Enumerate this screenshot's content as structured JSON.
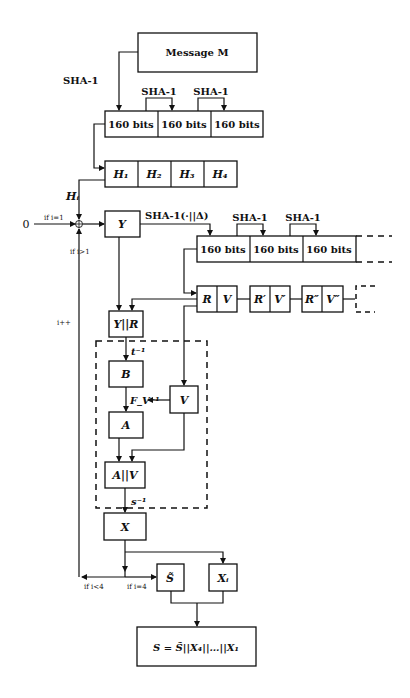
{
  "message": "Message M",
  "sha1": "SHA-1",
  "sha1_delta": "SHA-1(·||Δ)",
  "bits_block": "160 bits",
  "h_blocks": [
    "H₁",
    "H₂",
    "H₃",
    "H₄"
  ],
  "h_i": "Hᵢ",
  "zero": "0",
  "if_i_eq_1": "if i=1",
  "if_i_gt_1": "if i>1",
  "i_inc": "i++",
  "Y": "Y",
  "rv_pairs": [
    {
      "r": "R",
      "v": "V"
    },
    {
      "r": "R′",
      "v": "V′"
    },
    {
      "r": "R″",
      "v": "V″"
    }
  ],
  "y_concat_r": "Y||R",
  "t_inv": "t⁻¹",
  "B": "B",
  "f_v_inv": "F_V⁻¹",
  "V": "V",
  "A": "A",
  "a_concat_v": "A||V",
  "s_inv": "s⁻¹",
  "X": "X",
  "if_i_lt_4": "if i<4",
  "if_i_eq_4": "if i=4",
  "s_tilde": "S̃",
  "x_i": "Xᵢ",
  "result": "S = S̃||X₄||…||X₁"
}
